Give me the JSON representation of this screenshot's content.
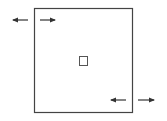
{
  "diagram": {
    "colors": {
      "stroke": "#444444",
      "arrow": "#333333",
      "background": "#ffffff"
    },
    "shapes": [
      {
        "name": "outer-rectangle",
        "kind": "rectangle"
      },
      {
        "name": "center-square",
        "kind": "square"
      }
    ],
    "arrows": [
      {
        "name": "top-left-arrow-left",
        "direction": "left",
        "group": "top-left"
      },
      {
        "name": "top-left-arrow-right",
        "direction": "right",
        "group": "top-left"
      },
      {
        "name": "bottom-right-arrow-left",
        "direction": "left",
        "group": "bottom-right"
      },
      {
        "name": "bottom-right-arrow-right",
        "direction": "right",
        "group": "bottom-right"
      }
    ]
  }
}
